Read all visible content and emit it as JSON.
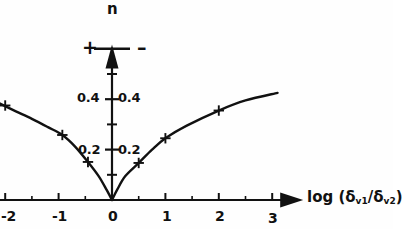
{
  "figure": {
    "name": "viscosity-ratio-exponent-plot",
    "y_axis_symbol": "n",
    "x_axis_label_prefix": "log (",
    "x_axis_label_num": "δ",
    "x_axis_label_num_sub": "v1",
    "x_axis_label_slash": "/",
    "x_axis_label_den": "δ",
    "x_axis_label_den_sub": "v2",
    "x_axis_label_suffix": ")",
    "sign_left": "+",
    "sign_right": "–",
    "line_color": "#111111",
    "axis_color": "#111111",
    "background": "#fefefe"
  },
  "chart_data": {
    "type": "scatter",
    "title": "",
    "xlabel": "log (δv1/δv2)",
    "ylabel": "n",
    "xlim": [
      -2.15,
      3.15
    ],
    "ylim": [
      0.0,
      0.625
    ],
    "grid": false,
    "legend": null,
    "x_ticks_major": [
      -2,
      -1,
      0,
      1,
      2,
      3
    ],
    "x_tick_labels": [
      "-2",
      "-1",
      "0",
      "1",
      "2",
      "3"
    ],
    "x_ticks_minor": [
      -1.5,
      -0.5,
      0.5,
      1.5,
      2.5
    ],
    "y_ticks_major": [
      0.2,
      0.4
    ],
    "y_tick_labels_left": [
      "0.2",
      "0.4"
    ],
    "y_tick_labels_right": [
      "0.2",
      "0.4"
    ],
    "y_ticks_minor": [
      0.1,
      0.3,
      0.5
    ],
    "y_tick_sign_level": 0.6,
    "series": [
      {
        "name": "left branch (negative log ratio)",
        "marker": "+",
        "points": [
          {
            "x": -2.0,
            "y": 0.375
          },
          {
            "x": -0.93,
            "y": 0.258
          },
          {
            "x": -0.45,
            "y": 0.151
          }
        ],
        "curve": [
          {
            "x": -2.12,
            "y": 0.385
          },
          {
            "x": -1.8,
            "y": 0.352
          },
          {
            "x": -1.5,
            "y": 0.322
          },
          {
            "x": -1.2,
            "y": 0.289
          },
          {
            "x": -0.93,
            "y": 0.258
          },
          {
            "x": -0.7,
            "y": 0.214
          },
          {
            "x": -0.45,
            "y": 0.151
          },
          {
            "x": -0.25,
            "y": 0.095
          },
          {
            "x": -0.1,
            "y": 0.04
          },
          {
            "x": 0.0,
            "y": 0.0
          }
        ]
      },
      {
        "name": "right branch (positive log ratio)",
        "marker": "+",
        "points": [
          {
            "x": 0.5,
            "y": 0.147
          },
          {
            "x": 1.0,
            "y": 0.245
          },
          {
            "x": 2.0,
            "y": 0.355
          }
        ],
        "curve": [
          {
            "x": 0.0,
            "y": 0.0
          },
          {
            "x": 0.1,
            "y": 0.042
          },
          {
            "x": 0.25,
            "y": 0.095
          },
          {
            "x": 0.5,
            "y": 0.147
          },
          {
            "x": 0.75,
            "y": 0.2
          },
          {
            "x": 1.0,
            "y": 0.245
          },
          {
            "x": 1.4,
            "y": 0.295
          },
          {
            "x": 2.0,
            "y": 0.355
          },
          {
            "x": 2.5,
            "y": 0.395
          },
          {
            "x": 3.1,
            "y": 0.425
          }
        ]
      }
    ]
  }
}
